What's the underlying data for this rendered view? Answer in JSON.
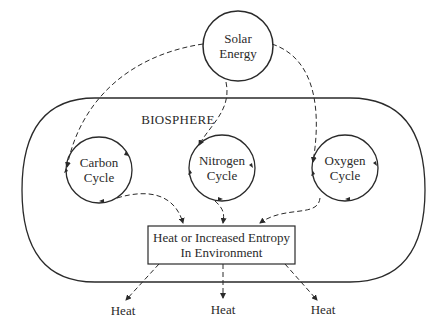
{
  "diagram": {
    "source_node": {
      "label_line1": "Solar",
      "label_line2": "Energy"
    },
    "container": {
      "label": "BIOSPHERE"
    },
    "cycles": [
      {
        "label_line1": "Carbon",
        "label_line2": "Cycle"
      },
      {
        "label_line1": "Nitrogen",
        "label_line2": "Cycle"
      },
      {
        "label_line1": "Oxygen",
        "label_line2": "Cycle"
      }
    ],
    "sink_node": {
      "label_line1": "Heat or Increased Entropy",
      "label_line2": "In Environment"
    },
    "outputs": [
      {
        "label": "Heat"
      },
      {
        "label": "Heat"
      },
      {
        "label": "Heat"
      }
    ],
    "colors": {
      "stroke": "#2a2a2a",
      "background": "#ffffff"
    }
  }
}
